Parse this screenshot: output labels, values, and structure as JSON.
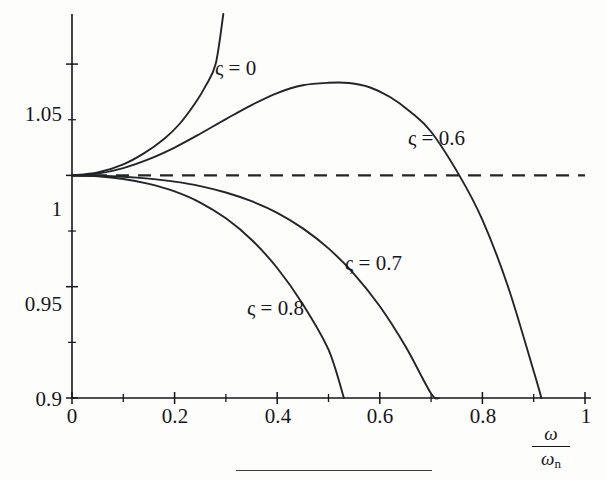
{
  "figure": {
    "background_color": "#fdfdfc",
    "line_color": "#232427",
    "axis_color": "#15161a"
  },
  "axes": {
    "x": {
      "title_numerator": "ω",
      "title_denominator": "ω",
      "title_denominator_subscript": "n",
      "ticks": [
        "0",
        "0.2",
        "0.4",
        "0.6",
        "0.8",
        "1"
      ],
      "tick_values": [
        0,
        0.2,
        0.4,
        0.6,
        0.8,
        1
      ],
      "minor_tick_values": [
        0.1,
        0.3,
        0.5,
        0.7,
        0.9
      ],
      "min": 0,
      "max": 1
    },
    "y": {
      "ticks": [
        "0.9",
        "0.95",
        "1",
        "1.05"
      ],
      "tick_values": [
        0.9,
        0.95,
        1,
        1.05
      ],
      "min": 0.9,
      "max": 1.0725
    }
  },
  "curve_labels": [
    {
      "id": "zeta-0",
      "text": "ς = 0",
      "x": 215,
      "y": 56
    },
    {
      "id": "zeta-06",
      "text": "ς = 0.6",
      "x": 408,
      "y": 126
    },
    {
      "id": "zeta-07",
      "text": "ς = 0.7",
      "x": 345,
      "y": 251
    },
    {
      "id": "zeta-08",
      "text": "ς = 0.8",
      "x": 247,
      "y": 296
    }
  ],
  "chart_data": {
    "type": "line",
    "title": "",
    "xlabel": "ω/ωn",
    "ylabel": "",
    "xlim": [
      0,
      1
    ],
    "ylim": [
      0.9,
      1.0725
    ],
    "grid": false,
    "legend": "inline curve labels",
    "reference_line": {
      "name": "unity reference",
      "y": 1,
      "style": "dashed",
      "x_from": 0,
      "x_to": 1
    },
    "series": [
      {
        "name": "ς = 0",
        "damping_ratio": 0,
        "style": "solid",
        "note": "rises steeply, leaves top of frame near x = 0.30",
        "x": [
          0,
          0.05,
          0.1,
          0.14,
          0.18,
          0.21,
          0.24,
          0.26,
          0.28,
          0.295
        ],
        "y": [
          1.0,
          1.0013,
          1.005,
          1.0099,
          1.0165,
          1.0232,
          1.0324,
          1.04,
          1.05,
          1.0725
        ]
      },
      {
        "name": "ς = 0.6",
        "damping_ratio": 0.6,
        "style": "solid",
        "note": "peak ≈ 1.0415 near x = 0.54; crosses unity near x = 0.755; exits bottom near x = 0.915",
        "x": [
          0,
          0.05,
          0.1,
          0.15,
          0.2,
          0.25,
          0.3,
          0.35,
          0.4,
          0.45,
          0.5,
          0.54,
          0.58,
          0.62,
          0.66,
          0.7,
          0.755,
          0.8,
          0.85,
          0.9,
          0.915
        ],
        "y": [
          1.0,
          1.0008,
          1.0033,
          1.0073,
          1.0125,
          1.0187,
          1.0253,
          1.0316,
          1.037,
          1.0405,
          1.0416,
          1.0415,
          1.0396,
          1.0352,
          1.0285,
          1.0196,
          1.0,
          0.98,
          0.95,
          0.912,
          0.9
        ]
      },
      {
        "name": "ς = 0.7",
        "damping_ratio": 0.7,
        "style": "solid",
        "note": "monotonically decreasing; exits bottom near x = 0.715",
        "x": [
          0,
          0.05,
          0.1,
          0.15,
          0.2,
          0.25,
          0.3,
          0.35,
          0.4,
          0.45,
          0.5,
          0.55,
          0.6,
          0.65,
          0.7,
          0.715
        ],
        "y": [
          1.0,
          0.99985,
          0.9994,
          0.99855,
          0.9972,
          0.9952,
          0.9923,
          0.9884,
          0.9832,
          0.9762,
          0.9672,
          0.9557,
          0.9412,
          0.9232,
          0.902,
          0.9
        ]
      },
      {
        "name": "ς = 0.8",
        "damping_ratio": 0.8,
        "style": "solid",
        "note": "steepest decay; exits bottom near x = 0.53",
        "x": [
          0,
          0.05,
          0.1,
          0.15,
          0.2,
          0.25,
          0.3,
          0.35,
          0.4,
          0.45,
          0.5,
          0.53
        ],
        "y": [
          1.0,
          0.9996,
          0.9984,
          0.9962,
          0.9928,
          0.9878,
          0.9807,
          0.9711,
          0.9584,
          0.9421,
          0.9217,
          0.9
        ]
      }
    ]
  }
}
